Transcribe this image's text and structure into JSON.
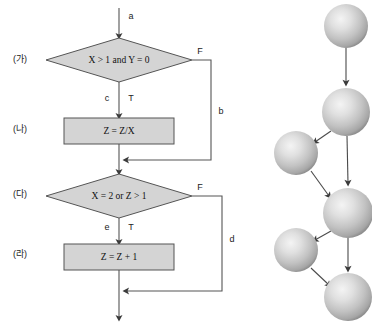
{
  "figure": {
    "colors": {
      "shape_fill": "#d4d4d4",
      "shape_stroke": "#555555",
      "line": "#555555",
      "graph_line": "#4a4a4a",
      "sphere_light": "#f0f0f0",
      "sphere_mid": "#c8c8c8",
      "sphere_dark": "#9a9a9a",
      "background": "#ffffff"
    }
  },
  "flowchart": {
    "side_labels": [
      {
        "id": "label-ga",
        "text": "(가)",
        "x": 20,
        "y": 60
      },
      {
        "id": "label-na",
        "text": "(나)",
        "x": 20,
        "y": 130
      },
      {
        "id": "label-da",
        "text": "(다)",
        "x": 20,
        "y": 195
      },
      {
        "id": "label-ra",
        "text": "(라)",
        "x": 20,
        "y": 255
      }
    ],
    "nodes": [
      {
        "id": "decision-1",
        "type": "decision",
        "text": "X > 1 and Y = 0",
        "cx": 119,
        "cy": 60,
        "rx": 73,
        "ry": 22
      },
      {
        "id": "process-1",
        "type": "process",
        "text": "Z = Z/X",
        "cx": 119,
        "cy": 131,
        "w": 110,
        "h": 26
      },
      {
        "id": "decision-2",
        "type": "decision",
        "text": "X = 2 or Z > 1",
        "cx": 119,
        "cy": 196,
        "rx": 73,
        "ry": 22
      },
      {
        "id": "process-2",
        "type": "process",
        "text": "Z = Z + 1",
        "cx": 119,
        "cy": 257,
        "w": 110,
        "h": 26
      }
    ],
    "edge_labels": [
      {
        "id": "edge-a",
        "text": "a",
        "x": 131,
        "y": 17
      },
      {
        "id": "edge-c",
        "text": "c",
        "x": 107,
        "y": 99
      },
      {
        "id": "edge-t1",
        "text": "T",
        "x": 131,
        "y": 99
      },
      {
        "id": "edge-f1",
        "text": "F",
        "x": 200,
        "y": 52
      },
      {
        "id": "edge-b",
        "text": "b",
        "x": 221,
        "y": 112
      },
      {
        "id": "edge-e",
        "text": "e",
        "x": 107,
        "y": 228
      },
      {
        "id": "edge-t2",
        "text": "T",
        "x": 131,
        "y": 228
      },
      {
        "id": "edge-f2",
        "text": "F",
        "x": 200,
        "y": 188
      },
      {
        "id": "edge-d",
        "text": "d",
        "x": 232,
        "y": 240
      }
    ],
    "geometry": {
      "spine_x": 119,
      "entry_y": 8,
      "exit_y": 320,
      "branch_b_x": 211,
      "branch_b_merge_y": 160,
      "branch_d_x": 222,
      "branch_d_merge_y": 291
    }
  },
  "graph": {
    "spheres": [
      {
        "id": "node-1",
        "cx": 346,
        "cy": 26,
        "r": 22
      },
      {
        "id": "node-2",
        "cx": 346,
        "cy": 112,
        "r": 24
      },
      {
        "id": "node-3",
        "cx": 296,
        "cy": 153,
        "r": 22
      },
      {
        "id": "node-4",
        "cx": 348,
        "cy": 213,
        "r": 25
      },
      {
        "id": "node-5",
        "cx": 296,
        "cy": 250,
        "r": 22
      },
      {
        "id": "node-6",
        "cx": 348,
        "cy": 297,
        "r": 24
      }
    ],
    "edges": [
      {
        "id": "graph-edge-1-2",
        "from": "node-1",
        "to": "node-2"
      },
      {
        "id": "graph-edge-2-3",
        "from": "node-2",
        "to": "node-3"
      },
      {
        "id": "graph-edge-2-4",
        "from": "node-2",
        "to": "node-4"
      },
      {
        "id": "graph-edge-3-4",
        "from": "node-3",
        "to": "node-4"
      },
      {
        "id": "graph-edge-4-5",
        "from": "node-4",
        "to": "node-5"
      },
      {
        "id": "graph-edge-4-6",
        "from": "node-4",
        "to": "node-6"
      },
      {
        "id": "graph-edge-5-6",
        "from": "node-5",
        "to": "node-6"
      }
    ]
  }
}
